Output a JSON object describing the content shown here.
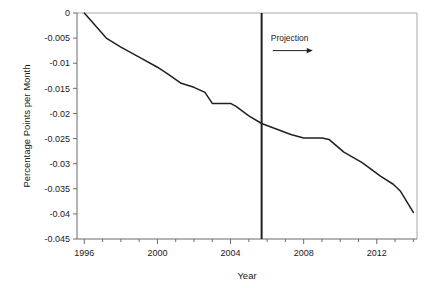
{
  "chart_data": {
    "type": "line",
    "title": "",
    "xlabel": "Year",
    "ylabel": "Percentage Points per Month",
    "xlim": [
      1995.6,
      2014.2
    ],
    "ylim": [
      -0.045,
      0
    ],
    "grid": false,
    "legend": null,
    "xticks": [
      1996,
      2000,
      2004,
      2008,
      2012
    ],
    "xtick_labels": [
      "1996",
      "2000",
      "2004",
      "2008",
      "2012"
    ],
    "xminor_tick_step": 1,
    "yticks": [
      0,
      -0.005,
      -0.01,
      -0.015,
      -0.02,
      -0.025,
      -0.03,
      -0.035,
      -0.04,
      -0.045
    ],
    "ytick_labels": [
      "0",
      "-0.005",
      "-0.01",
      "-0.015",
      "-0.02",
      "-0.025",
      "-0.03",
      "-0.035",
      "-0.04",
      "-0.045"
    ],
    "series": [
      {
        "name": "Percentage Points per Month",
        "color": "#231f20",
        "x": [
          1996.0,
          1997.2,
          1998.0,
          1999.0,
          2000.0,
          2000.6,
          2001.3,
          2002.0,
          2002.6,
          2003.0,
          2004.0,
          2004.3,
          2005.0,
          2005.7,
          2006.5,
          2007.3,
          2008.0,
          2009.0,
          2009.4,
          2010.2,
          2011.2,
          2012.2,
          2012.9,
          2013.3,
          2014.0
        ],
        "values": [
          0.0,
          -0.005,
          -0.0068,
          -0.0088,
          -0.0108,
          -0.0122,
          -0.014,
          -0.0148,
          -0.0158,
          -0.018,
          -0.018,
          -0.0186,
          -0.0205,
          -0.022,
          -0.0231,
          -0.0242,
          -0.0249,
          -0.0249,
          -0.0252,
          -0.0277,
          -0.0298,
          -0.0325,
          -0.0341,
          -0.0355,
          -0.0397
        ]
      }
    ],
    "annotations": [
      {
        "type": "vertical-line",
        "name": "projection-divider",
        "x": 2005.7,
        "color": "#231f20"
      },
      {
        "type": "text-with-arrow",
        "name": "projection-annotation",
        "label": "Projection",
        "arrow_direction": "right",
        "x": 2006.2,
        "y": -0.0055
      }
    ]
  },
  "axes": {
    "frame_color": "#a9a9a9",
    "line_color": "#231f20",
    "background": "#ffffff"
  }
}
